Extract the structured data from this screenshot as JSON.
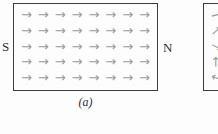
{
  "figure_a": {
    "caption": "(a)",
    "pole_left_label": "S",
    "pole_right_label": "N",
    "field_rows": 5,
    "field_cols": 8,
    "arrow_angle_deg": 0
  },
  "figure_b": {
    "arrow_angles_deg": [
      -15,
      -40,
      25,
      -90,
      -160
    ]
  },
  "icons": {
    "field_arrow_glyph": "→"
  },
  "colors": {
    "arrow": "#9b9b9b",
    "outline": "#3c3c3c",
    "text": "#2e2e2e",
    "background": "#fdfdfd"
  }
}
